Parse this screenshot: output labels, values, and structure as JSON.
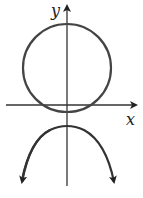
{
  "diagram": {
    "type": "graph-sketch",
    "axes": {
      "x_label": "x",
      "y_label": "y"
    },
    "curves": [
      {
        "name": "circle",
        "center": [
          0,
          1
        ],
        "description": "circle centered on y-axis above x-axis, dipping slightly below it"
      },
      {
        "name": "downward-parabola",
        "vertex": [
          0,
          -0.5
        ],
        "description": "downward-opening parabola with arrows on both ends"
      }
    ],
    "colors": {
      "stroke": "#333333",
      "background": "#ffffff"
    }
  }
}
